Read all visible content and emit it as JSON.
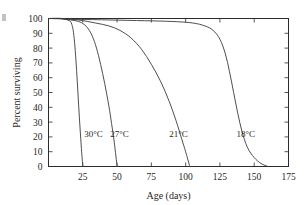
{
  "chart_data": {
    "type": "line",
    "title": "",
    "xlabel": "Age (days)",
    "ylabel": "Percent surviving",
    "xlim": [
      0,
      175
    ],
    "ylim": [
      0,
      100
    ],
    "xticks": [
      0,
      25,
      50,
      75,
      100,
      125,
      150,
      175
    ],
    "xtick_labels": [
      "",
      "25",
      "50",
      "75",
      "100",
      "125",
      "150",
      "175"
    ],
    "yticks": [
      0,
      10,
      20,
      30,
      40,
      50,
      60,
      70,
      80,
      90,
      100
    ],
    "ytick_labels": [
      "0",
      "10",
      "20",
      "30",
      "40",
      "50",
      "60",
      "70",
      "80",
      "90",
      "100"
    ],
    "grid": false,
    "legend": "inline annotations on curves",
    "line_color": "#3a3a3a",
    "axis_color": "#2b2b2b",
    "background": "#ffffff",
    "series": [
      {
        "name": "30°C",
        "label": "30°C",
        "label_x": 26,
        "label_y": 22,
        "x": [
          0,
          5,
          10,
          14,
          16,
          17,
          18,
          19,
          20,
          21,
          22,
          23,
          24,
          25
        ],
        "values": [
          100,
          100,
          100,
          99,
          98,
          96,
          92,
          84,
          72,
          57,
          41,
          26,
          12,
          0
        ]
      },
      {
        "name": "27°C",
        "label": "27°C",
        "label_x": 45,
        "label_y": 22,
        "x": [
          0,
          8,
          16,
          22,
          26,
          29,
          32,
          35,
          38,
          41,
          44,
          46,
          48,
          50
        ],
        "values": [
          100,
          100,
          99,
          98,
          96,
          93,
          88,
          80,
          69,
          56,
          41,
          29,
          16,
          0
        ]
      },
      {
        "name": "21°C",
        "label": "21°C",
        "label_x": 88,
        "label_y": 22,
        "x": [
          0,
          10,
          22,
          34,
          44,
          52,
          60,
          68,
          75,
          82,
          88,
          93,
          97,
          100,
          103
        ],
        "values": [
          100,
          100,
          99,
          97,
          95,
          92,
          87,
          79,
          69,
          57,
          44,
          31,
          19,
          10,
          0
        ]
      },
      {
        "name": "18°C",
        "label": "18°C",
        "label_x": 137,
        "label_y": 22,
        "x": [
          0,
          20,
          45,
          70,
          90,
          105,
          114,
          120,
          125,
          129,
          132,
          135,
          138,
          141,
          145,
          150,
          155,
          160
        ],
        "values": [
          100,
          99.5,
          99,
          98.5,
          98,
          97,
          95,
          92,
          86,
          76,
          64,
          50,
          36,
          24,
          13,
          6,
          2,
          0
        ]
      }
    ]
  },
  "figure": {
    "edge_mark": "partial-crop-mark"
  }
}
